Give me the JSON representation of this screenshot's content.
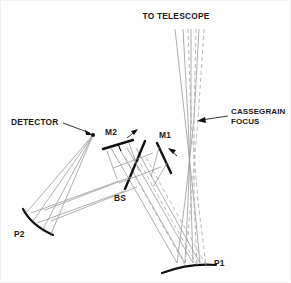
{
  "diagram": {
    "background_color": "#fefefe",
    "ray_solid_color": "#9a9a9a",
    "ray_dashed_color": "#a8a8a8",
    "optic_color": "#111111"
  },
  "labels": {
    "to_telescope": "TO TELESCOPE",
    "cassegrain_focus_line1": "CASSEGRAIN",
    "cassegrain_focus_line2": "FOCUS",
    "detector": "DETECTOR",
    "mirror_m2": "M2",
    "mirror_m1": "M1",
    "beam_splitter": "BS",
    "parabola_p2": "P2",
    "parabola_p1": "P1"
  },
  "components": [
    {
      "name": "to-telescope-beam",
      "label": "TO TELESCOPE",
      "kind": "beam-bundle"
    },
    {
      "name": "cassegrain-focus",
      "label": "CASSEGRAIN FOCUS",
      "kind": "focal-point"
    },
    {
      "name": "detector",
      "label": "DETECTOR",
      "kind": "detector-point"
    },
    {
      "name": "mirror-m2",
      "label": "M2",
      "kind": "flat-mirror"
    },
    {
      "name": "mirror-m1",
      "label": "M1",
      "kind": "flat-mirror"
    },
    {
      "name": "beam-splitter",
      "label": "BS",
      "kind": "beam-splitter"
    },
    {
      "name": "parabola-p2",
      "label": "P2",
      "kind": "curved-mirror"
    },
    {
      "name": "parabola-p1",
      "label": "P1",
      "kind": "curved-mirror"
    }
  ]
}
